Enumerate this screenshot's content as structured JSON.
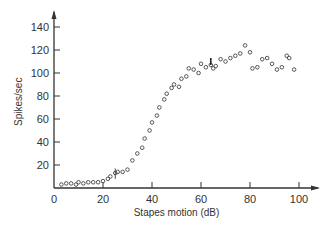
{
  "chart_data": {
    "type": "scatter",
    "title": "",
    "xlabel": "Stapes motion (dB)",
    "ylabel": "Spikes/sec",
    "xlim": [
      0,
      105
    ],
    "ylim": [
      0,
      150
    ],
    "x_ticks": [
      0,
      20,
      40,
      60,
      80,
      100
    ],
    "y_ticks": [
      20,
      40,
      60,
      80,
      100,
      120,
      140
    ],
    "grid": false,
    "legend": null,
    "marker": "open-circle",
    "series": [
      {
        "name": "responses",
        "points": [
          [
            3,
            3
          ],
          [
            5,
            4
          ],
          [
            7,
            4
          ],
          [
            9,
            3
          ],
          [
            10,
            5
          ],
          [
            12,
            4
          ],
          [
            14,
            5
          ],
          [
            16,
            5
          ],
          [
            18,
            5
          ],
          [
            20,
            6
          ],
          [
            22,
            8
          ],
          [
            23,
            10
          ],
          [
            25,
            13
          ],
          [
            26,
            14
          ],
          [
            28,
            14
          ],
          [
            30,
            16
          ],
          [
            32,
            24
          ],
          [
            34,
            30
          ],
          [
            36,
            35
          ],
          [
            37,
            43
          ],
          [
            39,
            50
          ],
          [
            40,
            57
          ],
          [
            42,
            63
          ],
          [
            43,
            70
          ],
          [
            45,
            77
          ],
          [
            46,
            82
          ],
          [
            48,
            87
          ],
          [
            49,
            90
          ],
          [
            51,
            88
          ],
          [
            52,
            95
          ],
          [
            54,
            97
          ],
          [
            55,
            104
          ],
          [
            57,
            103
          ],
          [
            59,
            100
          ],
          [
            60,
            108
          ],
          [
            62,
            105
          ],
          [
            64,
            107
          ],
          [
            65,
            104
          ],
          [
            66,
            106
          ],
          [
            68,
            112
          ],
          [
            70,
            110
          ],
          [
            72,
            113
          ],
          [
            74,
            115
          ],
          [
            76,
            117
          ],
          [
            78,
            124
          ],
          [
            80,
            118
          ],
          [
            81,
            104
          ],
          [
            83,
            105
          ],
          [
            85,
            112
          ],
          [
            87,
            113
          ],
          [
            89,
            108
          ],
          [
            91,
            103
          ],
          [
            93,
            105
          ],
          [
            95,
            115
          ],
          [
            96,
            113
          ],
          [
            98,
            103
          ]
        ]
      }
    ]
  },
  "axes": {
    "x_title": "Stapes motion (dB)",
    "y_title": "Spikes/sec",
    "x_tick_labels": [
      "0",
      "20",
      "40",
      "60",
      "80",
      "100"
    ],
    "y_tick_labels": [
      "20",
      "40",
      "60",
      "80",
      "100",
      "120",
      "140"
    ]
  }
}
